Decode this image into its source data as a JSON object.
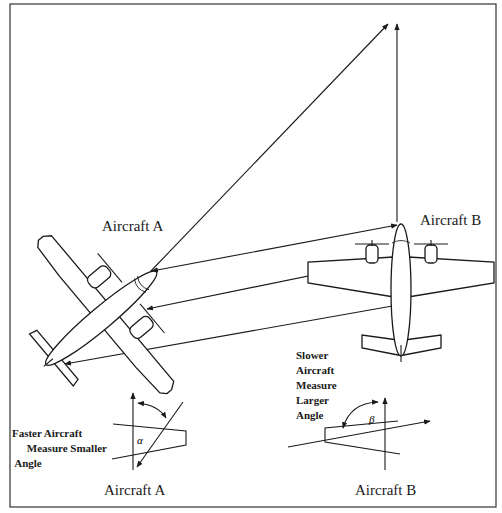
{
  "diagram": {
    "labels": {
      "aircraft_a_top": "Aircraft A",
      "aircraft_b_top": "Aircraft B",
      "aircraft_a_bottom": "Aircraft A",
      "aircraft_b_bottom": "Aircraft B",
      "faster_note": [
        "Faster Aircraft",
        "Measure Smaller",
        "Angle"
      ],
      "slower_note": [
        "Slower",
        "Aircraft",
        "Measure",
        "Larger",
        "Angle"
      ],
      "alpha": "α",
      "beta": "β"
    },
    "colors": {
      "line": "#1a1a1a",
      "background": "#ffffff",
      "border": "#333333"
    }
  }
}
